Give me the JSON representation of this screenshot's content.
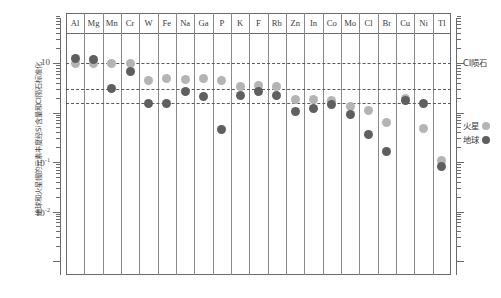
{
  "chart_data": {
    "type": "scatter",
    "title": "",
    "ylabel": "地球和火星幔的元素丰度经Si含量和CI陨石标准化",
    "xlabel": "",
    "categories": [
      "Al",
      "Mg",
      "Mn",
      "Cr",
      "W",
      "Fe",
      "Na",
      "Ga",
      "P",
      "K",
      "F",
      "Rb",
      "Zn",
      "In",
      "Co",
      "Mo",
      "Cl",
      "Br",
      "Cu",
      "Ni",
      "Tl"
    ],
    "yscale": "log",
    "ylim": [
      0.007,
      30
    ],
    "ytick_labels": [
      "10",
      "10⁻¹",
      "10⁻²"
    ],
    "ytick_values": [
      10,
      0.1,
      0.01
    ],
    "grid": false,
    "reference_lines": [
      {
        "label": "CI陨石",
        "value": 10
      },
      {
        "label": "",
        "value": 3.0
      },
      {
        "label": "",
        "value": 1.55
      }
    ],
    "legend_position": "right",
    "series": [
      {
        "name": "火星",
        "color": "#b4b4b4",
        "values": [
          10.0,
          10.0,
          9.6,
          9.9,
          4.5,
          4.9,
          4.6,
          4.8,
          4.4,
          3.3,
          3.5,
          3.3,
          1.85,
          1.8,
          1.75,
          1.35,
          1.1,
          0.62,
          1.9,
          0.48,
          0.105
        ]
      },
      {
        "name": "地球",
        "color": "#5f5f5f",
        "values": [
          12.5,
          12.0,
          3.05,
          6.6,
          1.5,
          1.5,
          2.6,
          2.1,
          2.65,
          2.2,
          2.6,
          2.2,
          1.05,
          1.2,
          1.45,
          0.9,
          0.36,
          0.16,
          1.72,
          1.5,
          0.083
        ]
      }
    ],
    "points": [
      {
        "element": "Al",
        "mars": 10.0,
        "earth": 12.5
      },
      {
        "element": "Mg",
        "mars": 10.0,
        "earth": 12.0
      },
      {
        "element": "Mn",
        "mars": 9.6,
        "earth": 3.05
      },
      {
        "element": "Cr",
        "mars": 9.9,
        "earth": 6.6
      },
      {
        "element": "W",
        "mars": 4.5,
        "earth": 1.5
      },
      {
        "element": "Fe",
        "mars": 4.9,
        "earth": 1.5
      },
      {
        "element": "Na",
        "mars": 4.6,
        "earth": 2.6
      },
      {
        "element": "Ga",
        "mars": 4.8,
        "earth": 2.1
      },
      {
        "element": "P",
        "mars": 4.4,
        "earth": 0.45
      },
      {
        "element": "K",
        "mars": 3.3,
        "earth": 2.2
      },
      {
        "element": "F",
        "mars": 3.5,
        "earth": 2.6
      },
      {
        "element": "Rb",
        "mars": 3.3,
        "earth": 2.2
      },
      {
        "element": "Zn",
        "mars": 1.85,
        "earth": 1.05
      },
      {
        "element": "In",
        "mars": 1.8,
        "earth": 1.2
      },
      {
        "element": "Co",
        "mars": 1.75,
        "earth": 1.45
      },
      {
        "element": "Mo",
        "mars": 1.35,
        "earth": 0.9
      },
      {
        "element": "Cl",
        "mars": 1.1,
        "earth": 0.36
      },
      {
        "element": "Br",
        "mars": 0.62,
        "earth": 0.16
      },
      {
        "element": "Cu",
        "mars": 1.9,
        "earth": 1.72
      },
      {
        "element": "Ni",
        "mars": 0.48,
        "earth": 1.5
      },
      {
        "element": "Tl",
        "mars": 0.105,
        "earth": 0.083
      }
    ]
  },
  "legend": {
    "ci_label": "CI陨石",
    "mars_label": "火星",
    "earth_label": "地球",
    "mars_color": "#b4b4b4",
    "earth_color": "#5f5f5f"
  },
  "axis": {
    "ylabel": "地球和火星幔的元素丰度经Si含量和CI陨石标准化",
    "tick_10": "10",
    "tick_1em1_base": "10",
    "tick_1em1_exp": "-1",
    "tick_1em2_base": "10",
    "tick_1em2_exp": "-2"
  }
}
